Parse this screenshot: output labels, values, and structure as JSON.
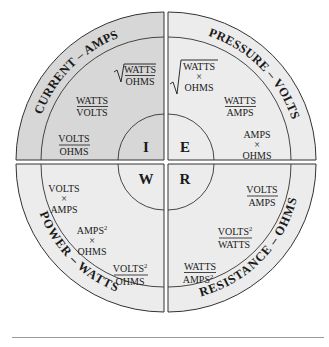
{
  "colors": {
    "current_fill": "#d7d7d7",
    "other_fill": "#ececec",
    "stroke": "#333333",
    "text": "#1a1a1a"
  },
  "quadrants": {
    "current": {
      "title": "CURRENT – AMPS",
      "symbol": "I",
      "formulas": {
        "f1_num": "WATTS",
        "f1_den": "OHMS",
        "f1_type": "sqrt-fraction",
        "f2_num": "WATTS",
        "f2_den": "VOLTS",
        "f3_num": "VOLTS",
        "f3_den": "OHMS"
      }
    },
    "pressure": {
      "title": "PRESSURE – VOLTS",
      "symbol": "E",
      "formulas": {
        "f1_a": "WATTS",
        "f1_op": "×",
        "f1_b": "OHMS",
        "f1_type": "sqrt-product",
        "f2_num": "WATTS",
        "f2_den": "AMPS",
        "f3_a": "AMPS",
        "f3_op": "×",
        "f3_b": "OHMS"
      }
    },
    "power": {
      "title": "POWER – WATTS",
      "symbol": "W",
      "formulas": {
        "f1_a": "VOLTS",
        "f1_op": "×",
        "f1_b": "AMPS",
        "f2_a": "AMPS",
        "f2_a_exp": "2",
        "f2_op": "×",
        "f2_b": "OHMS",
        "f3_num": "VOLTS",
        "f3_num_exp": "2",
        "f3_den": "OHMS"
      }
    },
    "resistance": {
      "title": "RESISTANCE – OHMS",
      "symbol": "R",
      "formulas": {
        "f1_num": "VOLTS",
        "f1_den": "AMPS",
        "f2_num": "VOLTS",
        "f2_num_exp": "2",
        "f2_den": "WATTS",
        "f3_num": "WATTS",
        "f3_den": "AMPS",
        "f3_den_exp": "2"
      }
    }
  }
}
